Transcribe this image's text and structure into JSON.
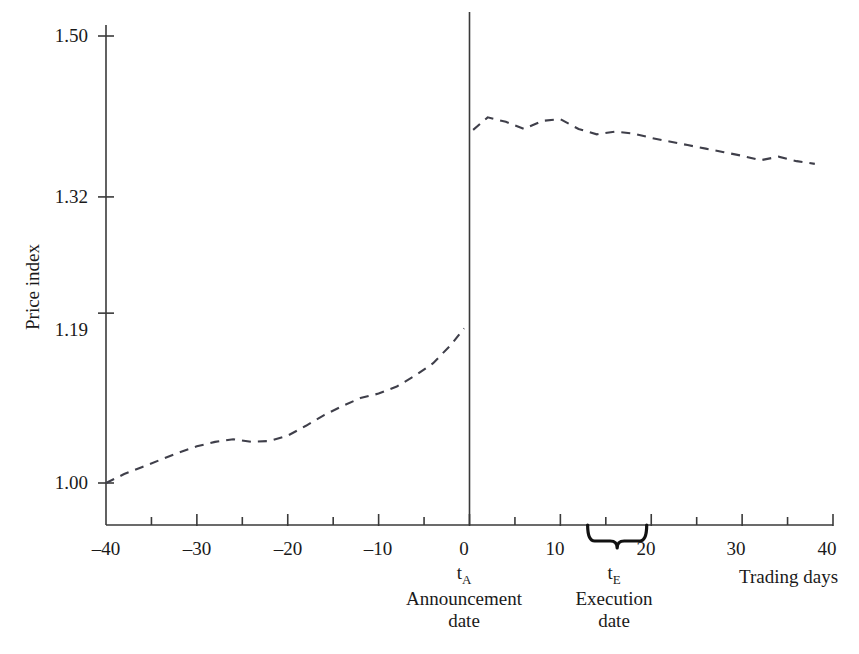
{
  "chart_data": {
    "type": "line",
    "title": "",
    "subtitle": "",
    "xlabel": "Trading days",
    "ylabel": "Price index",
    "xlim": [
      -40,
      40
    ],
    "ylim": [
      0.955,
      1.535
    ],
    "grid": false,
    "legend": "none",
    "line_style": "dashed",
    "y_tick_values": [
      1.5,
      1.32,
      1.19,
      1.0
    ],
    "y_tick_labels": [
      "1.50",
      "1.32",
      "1.19",
      "1.00"
    ],
    "x_tick_values": [
      -40,
      -30,
      -20,
      -10,
      0,
      10,
      20,
      30,
      40
    ],
    "x_tick_labels": [
      "–40",
      "–30",
      "–20",
      "–10",
      "0",
      "10",
      "20",
      "30",
      "40"
    ],
    "x_minor_tick_step": 5,
    "annotations": [
      {
        "name": "announcement-date",
        "symbol": "t",
        "subscript": "A",
        "caption_line1": "Announcement",
        "caption_line2": "date",
        "x": 0,
        "marker": "vertical-line"
      },
      {
        "name": "execution-date",
        "symbol": "t",
        "subscript": "E",
        "caption_line1": "Execution",
        "caption_line2": "date",
        "x_start": 13,
        "x_end": 19.5,
        "marker": "brace"
      }
    ],
    "series": [
      {
        "name": "Pre-announcement price index",
        "segment": "pre",
        "x": [
          -40,
          -38,
          -36,
          -34,
          -32,
          -30,
          -28,
          -26,
          -24,
          -22,
          -20,
          -18,
          -16,
          -14,
          -12,
          -10,
          -8,
          -6,
          -4,
          -2,
          -0.6
        ],
        "values": [
          1.0,
          1.01,
          1.018,
          1.026,
          1.034,
          1.041,
          1.046,
          1.049,
          1.046,
          1.047,
          1.053,
          1.064,
          1.076,
          1.086,
          1.095,
          1.1,
          1.108,
          1.12,
          1.134,
          1.155,
          1.173
        ]
      },
      {
        "name": "Post-announcement price index",
        "segment": "post",
        "x": [
          0.4,
          2,
          4,
          6,
          8,
          10,
          12,
          14,
          16,
          18,
          20,
          22,
          24,
          26,
          28,
          30,
          32,
          34,
          36,
          38
        ],
        "values": [
          1.395,
          1.409,
          1.404,
          1.396,
          1.405,
          1.407,
          1.396,
          1.39,
          1.393,
          1.391,
          1.386,
          1.382,
          1.378,
          1.374,
          1.37,
          1.366,
          1.361,
          1.365,
          1.36,
          1.357
        ]
      }
    ],
    "discontinuity": {
      "at_x": 0,
      "value_before": 1.173,
      "value_after": 1.395
    }
  },
  "colors": {
    "background": "#ffffff",
    "axis": "#3a3a3a",
    "series": "#3f3f4a",
    "text": "#1a1a1a",
    "brace": "#111111"
  }
}
